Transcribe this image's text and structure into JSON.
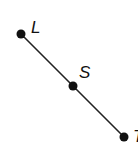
{
  "diagram": {
    "type": "line-segment",
    "points": [
      {
        "label": "L",
        "x": 21,
        "y": 34
      },
      {
        "label": "S",
        "x": 73,
        "y": 86
      },
      {
        "label": "T",
        "x": 124,
        "y": 137
      }
    ],
    "line_color": "#222222",
    "point_color": "#111111"
  }
}
